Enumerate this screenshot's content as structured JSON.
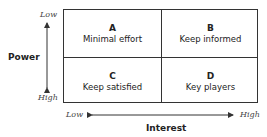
{
  "y_axis": {
    "label": "Power",
    "low": "Low",
    "high": "High"
  },
  "x_axis": {
    "label": "Interest",
    "low": "Low",
    "high": "High"
  },
  "quadrants": [
    {
      "letter": "A",
      "text": "Minimal effort"
    },
    {
      "letter": "B",
      "text": "Keep informed"
    },
    {
      "letter": "C",
      "text": "Keep satisfied"
    },
    {
      "letter": "D",
      "text": "Key players"
    }
  ]
}
